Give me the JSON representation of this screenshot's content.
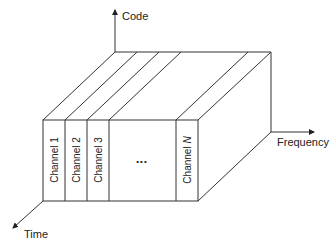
{
  "diagram": {
    "axes": {
      "code": "Code",
      "frequency": "Frequency",
      "time": "Time"
    },
    "channels": [
      {
        "label": "Channel 1"
      },
      {
        "label": "Channel 2"
      },
      {
        "label": "Channel 3"
      }
    ],
    "ellipsis": "•••",
    "last_channel": {
      "prefix": "Channel ",
      "italic": "N"
    },
    "colors": {
      "line": "#333333",
      "background": "#ffffff",
      "text": "#222222"
    }
  }
}
